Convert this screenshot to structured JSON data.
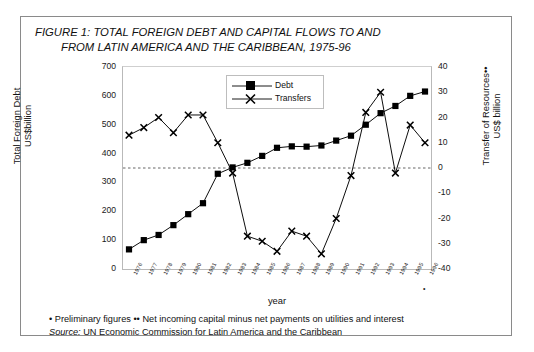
{
  "figure": {
    "title_line1": "FIGURE 1: TOTAL FOREIGN DEBT AND CAPITAL FLOWS TO AND",
    "title_line2": "FROM LATIN AMERICA AND THE CARIBBEAN, 1975-96",
    "note_preliminary": "• Preliminary figures •• Net incoming capital minus net payments on utilities and interest",
    "source_label": "Source:",
    "source_text": " UN Economic Commission for Latin America and the Caribbean",
    "footnote_marker": "•"
  },
  "colors": {
    "series_debt": "#000000",
    "series_transfers": "#000000",
    "axis": "#1a1a1a",
    "grid": "#cfcfcf",
    "zero_line": "#555555",
    "frame": "#8a8a8a",
    "background": "#ffffff"
  },
  "chart_data": {
    "type": "line",
    "title": "FIGURE 1: TOTAL FOREIGN DEBT AND CAPITAL FLOWS TO AND FROM LATIN AMERICA AND THE CARIBBEAN, 1975-96",
    "xlabel": "year",
    "ylabel": "Total Foreign Debt US$billion",
    "ylabel_right": "Transfer of Resources•• US$ billion",
    "ylim": [
      0,
      700
    ],
    "ylim_right": [
      -40,
      40
    ],
    "yticks": [
      0,
      100,
      200,
      300,
      400,
      500,
      600,
      700
    ],
    "yticks_right": [
      -40,
      -30,
      -20,
      -10,
      0,
      10,
      20,
      30,
      40
    ],
    "grid": false,
    "legend_position": "top-center",
    "categories": [
      "1976",
      "1977",
      "1978",
      "1979",
      "1980",
      "1981",
      "1982",
      "1983",
      "1984",
      "1985",
      "1986",
      "1987",
      "1988",
      "1989",
      "1990",
      "1991",
      "1992",
      "1993",
      "1994",
      "1995",
      "1996"
    ],
    "series": [
      {
        "name": "Debt",
        "axis": "left",
        "marker": "filled-square",
        "values": [
          68,
          100,
          118,
          152,
          190,
          228,
          330,
          352,
          368,
          392,
          420,
          425,
          424,
          428,
          445,
          462,
          500,
          540,
          565,
          600,
          615
        ]
      },
      {
        "name": "Transfers",
        "axis": "right",
        "marker": "cross",
        "values": [
          13,
          16,
          20,
          14,
          21,
          21,
          10,
          -2,
          -27,
          -29,
          -33,
          -25,
          -27,
          -34,
          -20,
          -3,
          22,
          30,
          -2,
          17,
          10
        ]
      }
    ],
    "zero_reference_line": 0
  },
  "legend": {
    "items": [
      {
        "label": "Debt",
        "marker": "filled-square"
      },
      {
        "label": "Transfers",
        "marker": "cross"
      }
    ]
  },
  "axes": {
    "left_title_line1": "Total Foreign Debt",
    "left_title_line2": "US$billion",
    "right_title_line1": "Transfer of  Resources••",
    "right_title_line2": "US$ billion",
    "x_title": "year"
  }
}
